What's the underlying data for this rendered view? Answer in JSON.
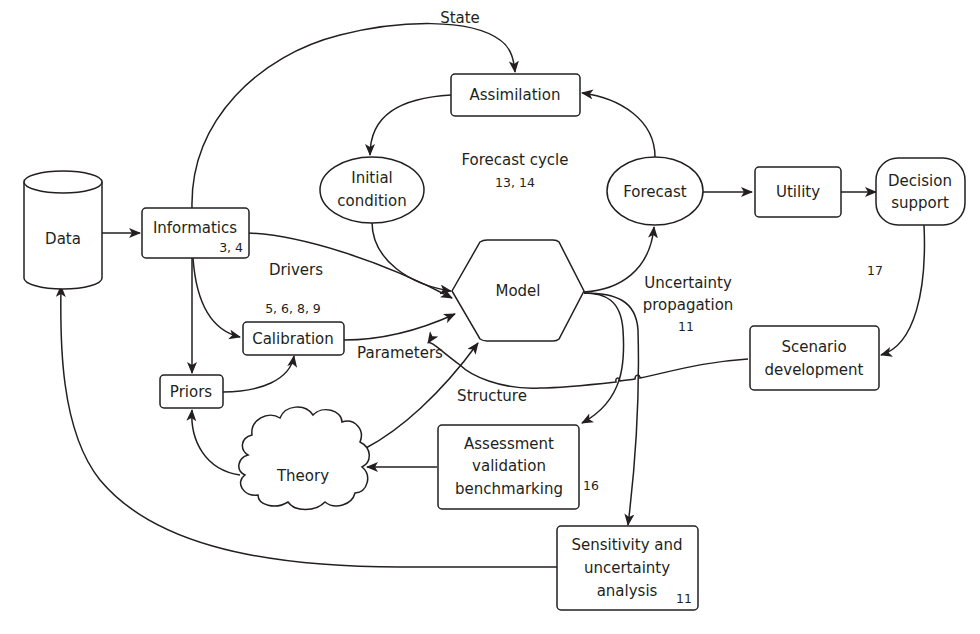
{
  "diagram": {
    "type": "flowchart",
    "nodes": {
      "data": {
        "label": "Data",
        "shape": "cylinder"
      },
      "informatics": {
        "label": "Informatics",
        "ref": "3, 4",
        "shape": "rounded-rect"
      },
      "calibration": {
        "label": "Calibration",
        "ref": "5, 6, 8, 9",
        "shape": "rounded-rect"
      },
      "priors": {
        "label": "Priors",
        "shape": "rounded-rect"
      },
      "theory": {
        "label": "Theory",
        "shape": "cloud"
      },
      "model": {
        "label": "Model",
        "shape": "hexagon"
      },
      "assimilation": {
        "label": "Assimilation",
        "shape": "rounded-rect"
      },
      "initial_condition": {
        "line1": "Initial",
        "line2": "condition",
        "shape": "ellipse"
      },
      "forecast": {
        "label": "Forecast",
        "shape": "ellipse"
      },
      "utility": {
        "label": "Utility",
        "shape": "rounded-rect"
      },
      "decision_support": {
        "line1": "Decision",
        "line2": "support",
        "shape": "stadium"
      },
      "scenario_development": {
        "line1": "Scenario",
        "line2": "development",
        "shape": "rounded-rect"
      },
      "assessment": {
        "line1": "Assessment",
        "line2": "validation",
        "line3": "benchmarking",
        "ref": "16",
        "shape": "rounded-rect"
      },
      "sensitivity": {
        "line1": "Sensitivity and",
        "line2": "uncertainty",
        "line3": "analysis",
        "ref": "11",
        "shape": "rounded-rect"
      }
    },
    "labels": {
      "state": "State",
      "forecast_cycle": "Forecast cycle",
      "forecast_cycle_ref": "13, 14",
      "drivers": "Drivers",
      "parameters": "Parameters",
      "structure": "Structure",
      "uncertainty_line1": "Uncertainty",
      "uncertainty_line2": "propagation",
      "uncertainty_ref": "11",
      "decision_ref": "17"
    },
    "edges": [
      {
        "from": "Data",
        "to": "Informatics"
      },
      {
        "from": "Informatics",
        "to": "Assimilation",
        "label": "State"
      },
      {
        "from": "Informatics",
        "to": "Model",
        "label": "Drivers"
      },
      {
        "from": "Informatics",
        "to": "Calibration"
      },
      {
        "from": "Informatics",
        "to": "Priors"
      },
      {
        "from": "Priors",
        "to": "Calibration"
      },
      {
        "from": "Calibration",
        "to": "Model",
        "label": "Parameters"
      },
      {
        "from": "Theory",
        "to": "Model",
        "label": "Structure"
      },
      {
        "from": "Theory",
        "to": "Priors"
      },
      {
        "from": "Assimilation",
        "to": "Initial condition"
      },
      {
        "from": "Initial condition",
        "to": "Model"
      },
      {
        "from": "Model",
        "to": "Forecast",
        "label": "Uncertainty propagation"
      },
      {
        "from": "Forecast",
        "to": "Assimilation"
      },
      {
        "from": "Forecast",
        "to": "Utility"
      },
      {
        "from": "Utility",
        "to": "Decision support"
      },
      {
        "from": "Decision support",
        "to": "Scenario development"
      },
      {
        "from": "Scenario development",
        "to": "Model"
      },
      {
        "from": "Model",
        "to": "Assessment validation benchmarking"
      },
      {
        "from": "Model",
        "to": "Sensitivity and uncertainty analysis"
      },
      {
        "from": "Assessment validation benchmarking",
        "to": "Theory"
      },
      {
        "from": "Sensitivity and uncertainty analysis",
        "to": "Data"
      }
    ]
  }
}
